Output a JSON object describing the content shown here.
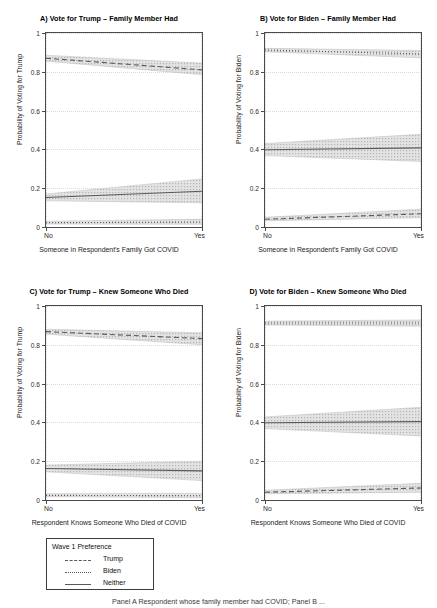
{
  "figure": {
    "width": 437,
    "height": 608,
    "caption": "Panel A Respondent whose family member had COVID; Panel B ..."
  },
  "legend": {
    "title": "Wave 1 Preference",
    "items": [
      {
        "label": "Trump",
        "style": "dashed"
      },
      {
        "label": "Biden",
        "style": "dotted"
      },
      {
        "label": "Neither",
        "style": "solid"
      }
    ]
  },
  "colors": {
    "line": "#595959",
    "ribbon": "#c9c9c9",
    "frame": "#4a4a4a",
    "grid": "#d9d9d9",
    "background": "#ffffff"
  },
  "chart_data": [
    {
      "type": "line",
      "panel": "A",
      "title": "A) Vote for Trump – Family Member Had",
      "xlabel": "Someone in Respondent's Family Got COVID",
      "ylabel": "Probability of Voting for Trump",
      "x": [
        0,
        1
      ],
      "xticklabels": [
        "No",
        "Yes"
      ],
      "ylim": [
        0,
        1
      ],
      "yticks": [
        0,
        0.2,
        0.4,
        0.6,
        0.8,
        1
      ],
      "yticklabels": [
        "0",
        "0.2",
        "0.4",
        "0.6",
        "0.8",
        "1"
      ],
      "grid": true,
      "series": [
        {
          "name": "Trump",
          "style": "dashed",
          "values": [
            0.87,
            0.81
          ],
          "ci_low": [
            0.855,
            0.785
          ],
          "ci_high": [
            0.885,
            0.845
          ]
        },
        {
          "name": "Neither",
          "style": "solid",
          "values": [
            0.152,
            0.184
          ],
          "ci_low": [
            0.135,
            0.125
          ],
          "ci_high": [
            0.17,
            0.248
          ]
        },
        {
          "name": "Biden",
          "style": "dotted",
          "values": [
            0.022,
            0.026
          ],
          "ci_low": [
            0.015,
            0.014
          ],
          "ci_high": [
            0.03,
            0.04
          ]
        }
      ]
    },
    {
      "type": "line",
      "panel": "B",
      "title": "B) Vote for Biden – Family Member Had",
      "xlabel": "Someone in Respondent's Family Got COVID",
      "ylabel": "Probability of Voting for Biden",
      "x": [
        0,
        1
      ],
      "xticklabels": [
        "No",
        "Yes"
      ],
      "ylim": [
        0,
        1
      ],
      "yticks": [
        0,
        0.2,
        0.4,
        0.6,
        0.8,
        1
      ],
      "yticklabels": [
        "0",
        "0.2",
        "0.4",
        "0.6",
        "0.8",
        "1"
      ],
      "grid": true,
      "series": [
        {
          "name": "Biden",
          "style": "dotted",
          "values": [
            0.912,
            0.892
          ],
          "ci_low": [
            0.903,
            0.872
          ],
          "ci_high": [
            0.921,
            0.91
          ]
        },
        {
          "name": "Neither",
          "style": "solid",
          "values": [
            0.398,
            0.408
          ],
          "ci_low": [
            0.368,
            0.338
          ],
          "ci_high": [
            0.43,
            0.478
          ]
        },
        {
          "name": "Trump",
          "style": "dashed",
          "values": [
            0.04,
            0.068
          ],
          "ci_low": [
            0.032,
            0.048
          ],
          "ci_high": [
            0.05,
            0.092
          ]
        }
      ]
    },
    {
      "type": "line",
      "panel": "C",
      "title": "C) Vote for Trump – Knew Someone Who Died",
      "xlabel": "Respondent Knows Someone Who Died of COVID",
      "ylabel": "Probability of Voting for Trump",
      "x": [
        0,
        1
      ],
      "xticklabels": [
        "No",
        "Yes"
      ],
      "ylim": [
        0,
        1
      ],
      "yticks": [
        0,
        0.2,
        0.4,
        0.6,
        0.8,
        1
      ],
      "yticklabels": [
        "0",
        "0.2",
        "0.4",
        "0.6",
        "0.8",
        "1"
      ],
      "grid": true,
      "series": [
        {
          "name": "Trump",
          "style": "dashed",
          "values": [
            0.868,
            0.832
          ],
          "ci_low": [
            0.855,
            0.8
          ],
          "ci_high": [
            0.88,
            0.862
          ]
        },
        {
          "name": "Neither",
          "style": "solid",
          "values": [
            0.162,
            0.15
          ],
          "ci_low": [
            0.145,
            0.1
          ],
          "ci_high": [
            0.18,
            0.2
          ]
        },
        {
          "name": "Biden",
          "style": "dotted",
          "values": [
            0.024,
            0.022
          ],
          "ci_low": [
            0.017,
            0.012
          ],
          "ci_high": [
            0.032,
            0.034
          ]
        }
      ]
    },
    {
      "type": "line",
      "panel": "D",
      "title": "D) Vote for Biden – Knew Someone Who Died",
      "xlabel": "Respondent Knows Someone Who Died of COVID",
      "ylabel": "Probability of Voting for Biden",
      "x": [
        0,
        1
      ],
      "xticklabels": [
        "No",
        "Yes"
      ],
      "ylim": [
        0,
        1
      ],
      "yticks": [
        0,
        0.2,
        0.4,
        0.6,
        0.8,
        1
      ],
      "yticklabels": [
        "0",
        "0.2",
        "0.4",
        "0.6",
        "0.8",
        "1"
      ],
      "grid": true,
      "series": [
        {
          "name": "Biden",
          "style": "dotted",
          "values": [
            0.912,
            0.912
          ],
          "ci_low": [
            0.902,
            0.896
          ],
          "ci_high": [
            0.922,
            0.928
          ]
        },
        {
          "name": "Neither",
          "style": "solid",
          "values": [
            0.398,
            0.404
          ],
          "ci_low": [
            0.368,
            0.33
          ],
          "ci_high": [
            0.428,
            0.478
          ]
        },
        {
          "name": "Trump",
          "style": "dashed",
          "values": [
            0.04,
            0.062
          ],
          "ci_low": [
            0.032,
            0.04
          ],
          "ci_high": [
            0.05,
            0.086
          ]
        }
      ]
    }
  ]
}
